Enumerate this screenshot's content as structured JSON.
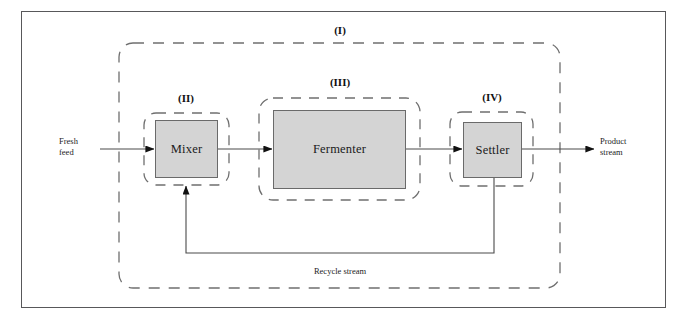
{
  "figure": {
    "type": "process-flow-diagram"
  },
  "zones": [
    {
      "id": "I",
      "label": "(I)",
      "name": "overall-process-boundary"
    },
    {
      "id": "II",
      "label": "(II)",
      "name": "mixer-boundary"
    },
    {
      "id": "III",
      "label": "(III)",
      "name": "fermenter-boundary"
    },
    {
      "id": "IV",
      "label": "(IV)",
      "name": "settler-boundary"
    }
  ],
  "units": [
    {
      "id": "mixer",
      "label": "Mixer"
    },
    {
      "id": "fermenter",
      "label": "Fermenter"
    },
    {
      "id": "settler",
      "label": "Settler"
    }
  ],
  "streams": [
    {
      "id": "fresh-feed",
      "line1": "Fresh",
      "line2": "feed"
    },
    {
      "id": "product-stream",
      "line1": "Product",
      "line2": "stream"
    },
    {
      "id": "recycle-stream",
      "label": "Recycle stream"
    }
  ],
  "colors": {
    "frame": "#58585a",
    "box_fill": "#d4d4d4",
    "box_stroke": "#6a6a6a",
    "dashed": "#6f6f6f",
    "line": "#4a4a4a",
    "text": "#1a1a1a",
    "background": "#ffffff"
  }
}
